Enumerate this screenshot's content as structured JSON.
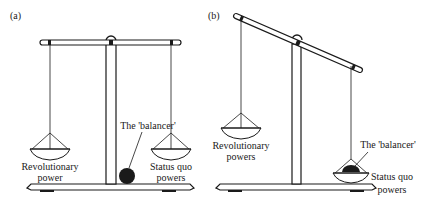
{
  "figure": {
    "panels": [
      {
        "id": "a",
        "label": "(a)",
        "state": "balanced",
        "left_pan_label": [
          "Revolutionary",
          "power"
        ],
        "right_pan_label": [
          "Status quo",
          "powers"
        ],
        "balancer_label": "The 'balancer'",
        "balancer_position": "on base, beside post (not in a pan)"
      },
      {
        "id": "b",
        "label": "(b)",
        "state": "tilted toward status quo side",
        "left_pan_label": [
          "Revolutionary",
          "powers"
        ],
        "right_pan_label": [
          "Status quo",
          "powers"
        ],
        "balancer_label": "The 'balancer'",
        "balancer_position": "in status quo pan"
      }
    ],
    "colors": {
      "ink": "#1a1a1a",
      "background": "#ffffff"
    }
  }
}
